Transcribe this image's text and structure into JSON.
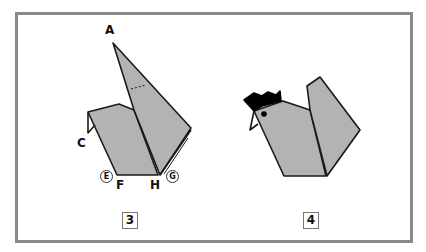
{
  "diagram": {
    "steps": [
      {
        "number": "3",
        "labels": {
          "A": "A",
          "C": "C",
          "E": "E",
          "F": "F",
          "H": "H",
          "G": "G"
        }
      },
      {
        "number": "4"
      }
    ],
    "colors": {
      "paper": "#b3b3b3",
      "outline": "#1a1a1a",
      "comb": "#000000",
      "frame": "#8a8a8a"
    }
  }
}
